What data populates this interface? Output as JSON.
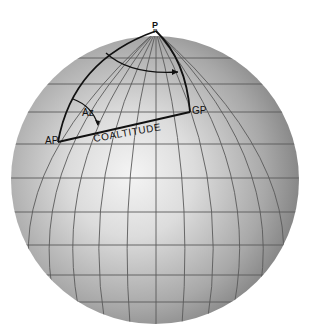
{
  "diagram": {
    "labels": {
      "pole": "P",
      "pole_sub": "n",
      "geographic_position": "GP",
      "assumed_position": "AP",
      "azimuth": "Az",
      "side": "COALTITUDE"
    },
    "colors": {
      "background": "#ffffff",
      "sphere_highlight": "#f2f2f2",
      "sphere_mid": "#c4c4c4",
      "sphere_shadow": "#7a7a7a",
      "grid": "#555555",
      "triangle": "#111111"
    }
  }
}
